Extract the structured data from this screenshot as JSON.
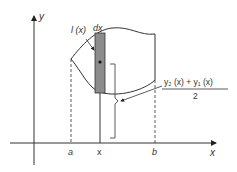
{
  "diagram": {
    "axes": {
      "x_label": "x",
      "y_label": "y"
    },
    "tick_labels": {
      "a": "a",
      "x": "x",
      "b": "b"
    },
    "annotations": {
      "strip_length": "l (x)",
      "strip_width": "dx",
      "formula_numerator": "y₂ (x) + y₁ (x)",
      "formula_denominator": "2"
    },
    "colors": {
      "line": "#333333",
      "strip_fill": "#8c8c8c",
      "background": "#ffffff"
    }
  }
}
